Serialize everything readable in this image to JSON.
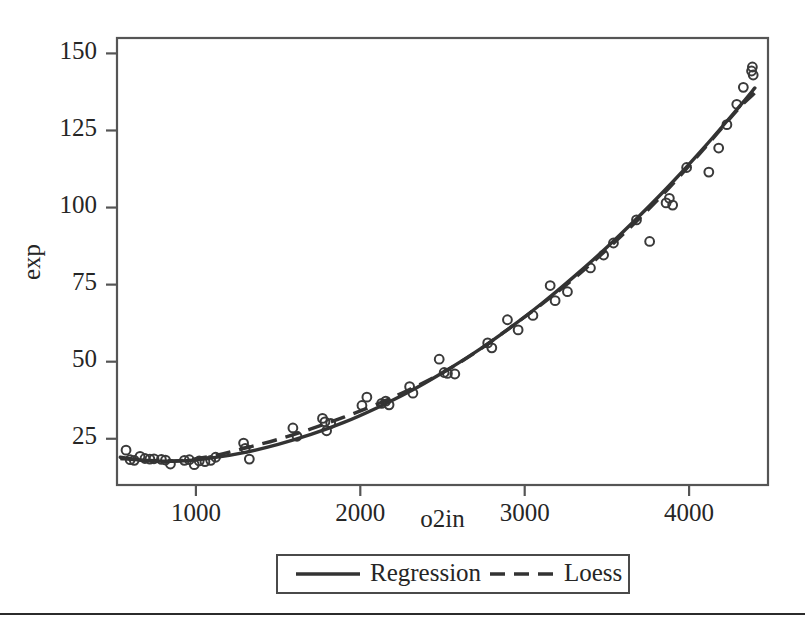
{
  "figure": {
    "background_color": "#ffffff",
    "ink_color": "#333333",
    "frame_color": "#555555",
    "rule_y": 613
  },
  "chart_data": {
    "type": "scatter",
    "title": "",
    "xlabel": "o2in",
    "ylabel": "exp",
    "xlim": [
      520,
      4480
    ],
    "ylim": [
      10,
      155
    ],
    "xticks": [
      1000,
      2000,
      3000,
      4000
    ],
    "yticks": [
      25,
      50,
      75,
      100,
      125,
      150
    ],
    "xtick_labels": [
      "1000",
      "2000",
      "3000",
      "4000"
    ],
    "ytick_labels": [
      "25",
      "50",
      "75",
      "100",
      "125",
      "150"
    ],
    "grid": false,
    "legend_position": "below-axes",
    "legend": [
      {
        "name": "Regression",
        "style": "solid"
      },
      {
        "name": "Loess",
        "style": "dashed"
      }
    ],
    "points": [
      {
        "x": 575,
        "y": 21.3
      },
      {
        "x": 600,
        "y": 18.2
      },
      {
        "x": 625,
        "y": 18.0
      },
      {
        "x": 660,
        "y": 19.3
      },
      {
        "x": 690,
        "y": 18.6
      },
      {
        "x": 720,
        "y": 18.4
      },
      {
        "x": 745,
        "y": 18.5
      },
      {
        "x": 790,
        "y": 18.3
      },
      {
        "x": 815,
        "y": 18.1
      },
      {
        "x": 845,
        "y": 16.8
      },
      {
        "x": 930,
        "y": 18.0
      },
      {
        "x": 960,
        "y": 18.2
      },
      {
        "x": 990,
        "y": 16.6
      },
      {
        "x": 1020,
        "y": 17.8
      },
      {
        "x": 1055,
        "y": 17.6
      },
      {
        "x": 1090,
        "y": 18.0
      },
      {
        "x": 1120,
        "y": 19.0
      },
      {
        "x": 1290,
        "y": 23.6
      },
      {
        "x": 1300,
        "y": 21.9
      },
      {
        "x": 1325,
        "y": 18.4
      },
      {
        "x": 1590,
        "y": 28.5
      },
      {
        "x": 1615,
        "y": 25.8
      },
      {
        "x": 1770,
        "y": 31.6
      },
      {
        "x": 1785,
        "y": 30.5
      },
      {
        "x": 1795,
        "y": 27.6
      },
      {
        "x": 1820,
        "y": 30.0
      },
      {
        "x": 2010,
        "y": 35.8
      },
      {
        "x": 2040,
        "y": 38.5
      },
      {
        "x": 2130,
        "y": 36.5
      },
      {
        "x": 2155,
        "y": 37.2
      },
      {
        "x": 2175,
        "y": 36.0
      },
      {
        "x": 2300,
        "y": 41.9
      },
      {
        "x": 2320,
        "y": 39.8
      },
      {
        "x": 2480,
        "y": 50.8
      },
      {
        "x": 2510,
        "y": 46.5
      },
      {
        "x": 2530,
        "y": 46.2
      },
      {
        "x": 2575,
        "y": 46.0
      },
      {
        "x": 2775,
        "y": 56.1
      },
      {
        "x": 2800,
        "y": 54.5
      },
      {
        "x": 2895,
        "y": 63.6
      },
      {
        "x": 2960,
        "y": 60.3
      },
      {
        "x": 3050,
        "y": 65.0
      },
      {
        "x": 3155,
        "y": 74.7
      },
      {
        "x": 3185,
        "y": 69.8
      },
      {
        "x": 3260,
        "y": 72.7
      },
      {
        "x": 3400,
        "y": 80.4
      },
      {
        "x": 3480,
        "y": 84.6
      },
      {
        "x": 3540,
        "y": 88.5
      },
      {
        "x": 3680,
        "y": 96.0
      },
      {
        "x": 3760,
        "y": 89.0
      },
      {
        "x": 3860,
        "y": 101.5
      },
      {
        "x": 3880,
        "y": 103.0
      },
      {
        "x": 3900,
        "y": 100.8
      },
      {
        "x": 3985,
        "y": 113.0
      },
      {
        "x": 4120,
        "y": 111.5
      },
      {
        "x": 4180,
        "y": 119.3
      },
      {
        "x": 4230,
        "y": 126.9
      },
      {
        "x": 4290,
        "y": 133.5
      },
      {
        "x": 4330,
        "y": 139.0
      },
      {
        "x": 4380,
        "y": 144.3
      },
      {
        "x": 4385,
        "y": 145.6
      },
      {
        "x": 4390,
        "y": 143.0
      }
    ],
    "series": [
      {
        "name": "Regression",
        "style": "solid",
        "x": [
          540,
          700,
          900,
          1100,
          1300,
          1500,
          1700,
          1900,
          2100,
          2300,
          2500,
          2700,
          2900,
          3100,
          3300,
          3500,
          3700,
          3900,
          4100,
          4300,
          4400
        ],
        "y": [
          19.0,
          17.9,
          17.8,
          18.8,
          20.6,
          23.2,
          26.4,
          30.3,
          35.0,
          40.3,
          46.4,
          53.1,
          60.6,
          68.7,
          77.6,
          87.1,
          97.4,
          108.3,
          120.0,
          132.4,
          138.8
        ]
      },
      {
        "name": "Loess",
        "style": "dashed",
        "x": [
          540,
          700,
          900,
          1100,
          1300,
          1500,
          1700,
          1900,
          2100,
          2300,
          2500,
          2700,
          2900,
          3100,
          3300,
          3500,
          3700,
          3900,
          4100,
          4300,
          4400
        ],
        "y": [
          18.6,
          18.0,
          17.9,
          19.4,
          22.0,
          24.8,
          28.2,
          32.0,
          36.2,
          41.0,
          46.4,
          53.0,
          60.6,
          68.5,
          77.0,
          86.4,
          96.6,
          107.6,
          119.6,
          132.0,
          137.2
        ]
      }
    ]
  },
  "axes": {
    "y_axis_title": "exp",
    "x_axis_title": "o2in"
  }
}
